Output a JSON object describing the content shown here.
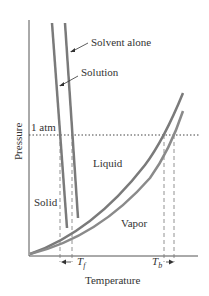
{
  "diagram": {
    "type": "phase-diagram",
    "x_axis_label": "Temperature",
    "y_axis_label": "Pressure",
    "reference_line_label": "1 atm",
    "regions": {
      "solid": "Solid",
      "liquid": "Liquid",
      "vapor": "Vapor"
    },
    "curve_labels": {
      "solvent": "Solvent alone",
      "solution": "Solution"
    },
    "temperature_markers": {
      "freezing": {
        "symbol": "T",
        "sub": "f"
      },
      "boiling": {
        "symbol": "T",
        "sub": "b"
      }
    },
    "colors": {
      "curve": "#7a7a7a",
      "axis": "#555555",
      "text": "#333333"
    }
  }
}
